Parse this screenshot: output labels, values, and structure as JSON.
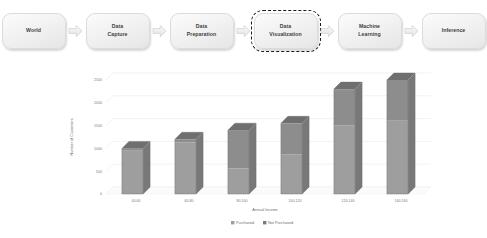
{
  "pipeline": {
    "stages": [
      {
        "label": "World",
        "highlighted": false
      },
      {
        "label": "Data\nCapture",
        "highlighted": false
      },
      {
        "label": "Data\nPreparation",
        "highlighted": false
      },
      {
        "label": "Data\nVisualization",
        "highlighted": true
      },
      {
        "label": "Machine\nLearning",
        "highlighted": false
      },
      {
        "label": "Inference",
        "highlighted": false
      }
    ],
    "arrow_icon": "arrow-right-icon"
  },
  "chart_data": {
    "type": "bar",
    "subtype": "stacked-3d-column",
    "title": "",
    "xlabel": "Annual Income",
    "ylabel": "Number of Customers",
    "categories": [
      "40-60",
      "60-80",
      "80-100",
      "100-120",
      "120-140",
      "140-160"
    ],
    "series": [
      {
        "name": "Purchased",
        "color": "#9a9a9a",
        "values": [
          950,
          1130,
          560,
          870,
          1500,
          1620
        ]
      },
      {
        "name": "Not Purchased",
        "color": "#8a8a8a",
        "values": [
          50,
          70,
          840,
          680,
          800,
          880
        ]
      }
    ],
    "totals": [
      1000,
      1200,
      1400,
      1550,
      2300,
      2500
    ],
    "ylim": [
      0,
      2500
    ],
    "yticks": [
      "0",
      "500",
      "1000",
      "1500",
      "2000",
      "2500"
    ],
    "ytick_values": [
      0,
      500,
      1000,
      1500,
      2000,
      2500
    ],
    "grid": true,
    "legend_position": "bottom"
  }
}
